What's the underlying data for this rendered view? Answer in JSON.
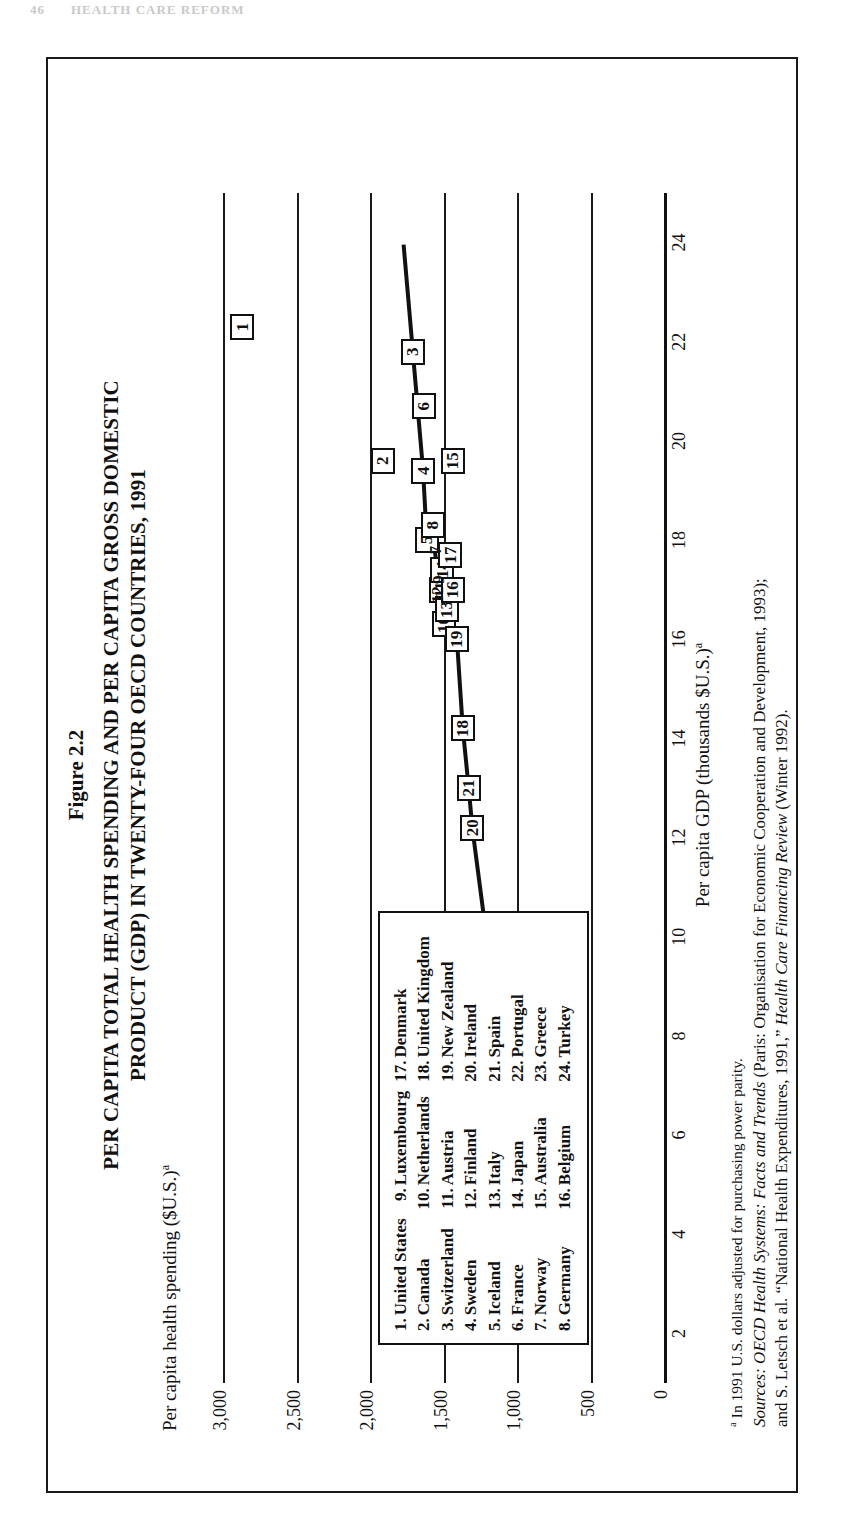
{
  "page": {
    "folio": "46",
    "running_head": "HEALTH CARE REFORM"
  },
  "figure": {
    "number": "Figure 2.2",
    "title_line1": "PER CAPITA TOTAL HEALTH SPENDING AND PER CAPITA GROSS DOMESTIC",
    "title_line2": "PRODUCT (GDP) IN TWENTY-FOUR OECD COUNTRIES, 1991",
    "note_marker": "a",
    "note_text": "In 1991 U.S. dollars adjusted for purchasing power parity.",
    "sources_label": "Sources:",
    "sources_line1_italic": "OECD Health Systems: Facts and Trends",
    "sources_line1_rest": " (Paris: Organisation for Economic Cooperation and Development, 1993);",
    "sources_line2_pre": "and S. Letsch et al. “National Health Expenditures, 1991,” ",
    "sources_line2_italic": "Health Care Financing Review",
    "sources_line2_rest": " (Winter 1992)."
  },
  "legend": {
    "columns": [
      [
        {
          "n": "1.",
          "name": "United States"
        },
        {
          "n": "2.",
          "name": "Canada"
        },
        {
          "n": "3.",
          "name": "Switzerland"
        },
        {
          "n": "4.",
          "name": "Sweden"
        },
        {
          "n": "5.",
          "name": "Iceland"
        },
        {
          "n": "6.",
          "name": "France"
        },
        {
          "n": "7.",
          "name": "Norway"
        },
        {
          "n": "8.",
          "name": "Germany"
        }
      ],
      [
        {
          "n": "9.",
          "name": "Luxembourg"
        },
        {
          "n": "10.",
          "name": "Netherlands"
        },
        {
          "n": "11.",
          "name": "Austria"
        },
        {
          "n": "12.",
          "name": "Finland"
        },
        {
          "n": "13.",
          "name": "Italy"
        },
        {
          "n": "14.",
          "name": "Japan"
        },
        {
          "n": "15.",
          "name": "Australia"
        },
        {
          "n": "16.",
          "name": "Belgium"
        }
      ],
      [
        {
          "n": "17.",
          "name": "Denmark"
        },
        {
          "n": "18.",
          "name": "United Kingdom"
        },
        {
          "n": "19.",
          "name": "New Zealand"
        },
        {
          "n": "20.",
          "name": "Ireland"
        },
        {
          "n": "21.",
          "name": "Spain"
        },
        {
          "n": "22.",
          "name": "Portugal"
        },
        {
          "n": "23.",
          "name": "Greece"
        },
        {
          "n": "24.",
          "name": "Turkey"
        }
      ]
    ]
  },
  "chart_data": {
    "type": "scatter",
    "title": "PER CAPITA TOTAL HEALTH SPENDING AND PER CAPITA GROSS DOMESTIC PRODUCT (GDP) IN TWENTY-FOUR OECD COUNTRIES, 1991",
    "xlabel": "Per capita GDP (thousands $U.S.)",
    "ylabel": "Per capita health spending ($U.S.)",
    "xlim": [
      1,
      25
    ],
    "ylim": [
      0,
      3200
    ],
    "xticks": [
      2,
      4,
      6,
      8,
      10,
      12,
      14,
      16,
      18,
      20,
      22,
      24
    ],
    "xticklabels": [
      "2",
      "4",
      "6",
      "8",
      "10",
      "12",
      "14",
      "16",
      "18",
      "20",
      "22",
      "24"
    ],
    "yticks": [
      0,
      500,
      1000,
      1500,
      2000,
      2500,
      3000
    ],
    "yticklabels": [
      "0",
      "500",
      "1,000",
      "1,500",
      "2,000",
      "2,500",
      "3,000"
    ],
    "grid": "horizontal",
    "legend_position": "inside-lower-left",
    "series_name": "OECD countries 1991",
    "trendline": true,
    "points": [
      {
        "id": "1",
        "label": "United States",
        "x": 22.3,
        "y": 2870
      },
      {
        "id": "2",
        "label": "Canada",
        "x": 19.6,
        "y": 1915
      },
      {
        "id": "3",
        "label": "Switzerland",
        "x": 21.8,
        "y": 1710
      },
      {
        "id": "4",
        "label": "Sweden",
        "x": 19.4,
        "y": 1640
      },
      {
        "id": "5",
        "label": "Iceland",
        "x": 18.0,
        "y": 1615
      },
      {
        "id": "6",
        "label": "France",
        "x": 20.7,
        "y": 1635
      },
      {
        "id": "7",
        "label": "Norway",
        "x": 17.8,
        "y": 1560
      },
      {
        "id": "8",
        "label": "Germany",
        "x": 18.3,
        "y": 1575
      },
      {
        "id": "9",
        "label": "Luxembourg",
        "x": 17.2,
        "y": 1540
      },
      {
        "id": "10",
        "label": "Netherlands",
        "x": 16.3,
        "y": 1500
      },
      {
        "id": "11",
        "label": "Austria",
        "x": 17.0,
        "y": 1520
      },
      {
        "id": "12",
        "label": "Finland",
        "x": 16.9,
        "y": 1545
      },
      {
        "id": "13",
        "label": "Italy",
        "x": 16.6,
        "y": 1480
      },
      {
        "id": "14",
        "label": "Japan",
        "x": 17.4,
        "y": 1510
      },
      {
        "id": "15",
        "label": "Australia",
        "x": 19.6,
        "y": 1440
      },
      {
        "id": "16",
        "label": "Belgium",
        "x": 17.0,
        "y": 1440
      },
      {
        "id": "17",
        "label": "Denmark",
        "x": 17.7,
        "y": 1455
      },
      {
        "id": "18",
        "label": "United Kingdom",
        "x": 14.2,
        "y": 1370
      },
      {
        "id": "19",
        "label": "New Zealand",
        "x": 16.0,
        "y": 1410
      },
      {
        "id": "20",
        "label": "Ireland",
        "x": 12.2,
        "y": 1305
      },
      {
        "id": "21",
        "label": "Spain",
        "x": 13.0,
        "y": 1330
      },
      {
        "id": "22",
        "label": "Portugal",
        "x": 9.8,
        "y": 1200
      },
      {
        "id": "23",
        "label": "Greece",
        "x": 8.2,
        "y": 1110
      },
      {
        "id": "24",
        "label": "Turkey",
        "x": 3.7,
        "y": 760
      }
    ]
  }
}
